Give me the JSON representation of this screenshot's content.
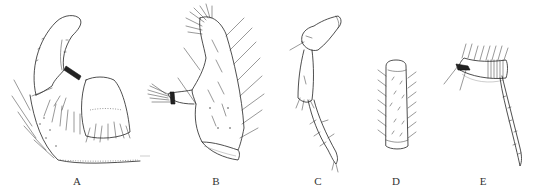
{
  "figure": {
    "type": "scientific-illustration-plate",
    "panels": [
      {
        "id": "A",
        "label": "A"
      },
      {
        "id": "B",
        "label": "B"
      },
      {
        "id": "C",
        "label": "C"
      },
      {
        "id": "D",
        "label": "D"
      },
      {
        "id": "E",
        "label": "E"
      }
    ]
  }
}
